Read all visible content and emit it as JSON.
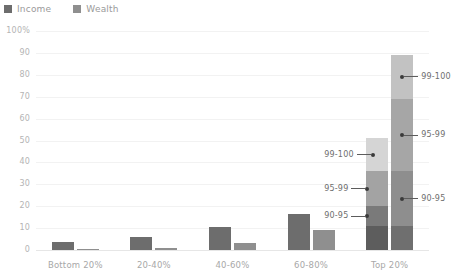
{
  "legend": {
    "items": [
      {
        "label": "Income",
        "color": "#6d6d6d",
        "icon": "square-swatch-icon"
      },
      {
        "label": "Wealth",
        "color": "#8f8f8f",
        "icon": "square-swatch-icon"
      }
    ]
  },
  "axis": {
    "y_ticks": [
      "100%",
      "90",
      "80",
      "70",
      "60",
      "50",
      "40",
      "30",
      "20",
      "10",
      "0"
    ],
    "x_ticks": [
      "Bottom 20%",
      "20-40%",
      "40-60%",
      "60-80%",
      "Top 20%"
    ]
  },
  "chart_data": {
    "type": "bar",
    "title": "",
    "xlabel": "",
    "ylabel": "",
    "ylim": [
      0,
      100
    ],
    "grid": true,
    "legend_position": "top-left",
    "categories": [
      "Bottom 20%",
      "20-40%",
      "40-60%",
      "60-80%",
      "Top 20%"
    ],
    "series": [
      {
        "name": "Income",
        "color": "#6d6d6d",
        "values": [
          3.5,
          6,
          10.5,
          16.5,
          51
        ]
      },
      {
        "name": "Wealth",
        "color": "#8f8f8f",
        "values": [
          0.6,
          1,
          3,
          9,
          89
        ]
      }
    ],
    "stacked_top_group": {
      "category": "Top 20%",
      "segment_labels": [
        "80-90",
        "90-95",
        "95-99",
        "99-100"
      ],
      "Income": {
        "segments": [
          {
            "label": "80-90",
            "value": 11,
            "color": "#5d5d5d"
          },
          {
            "label": "90-95",
            "value": 9,
            "color": "#7a7a7a"
          },
          {
            "label": "95-99",
            "value": 16,
            "color": "#a3a3a3"
          },
          {
            "label": "99-100",
            "value": 15,
            "color": "#d5d5d5"
          }
        ],
        "total": 51
      },
      "Wealth": {
        "segments": [
          {
            "label": "80-90",
            "value": 11,
            "color": "#6f6f6f"
          },
          {
            "label": "90-95",
            "value": 25,
            "color": "#8e8e8e"
          },
          {
            "label": "95-99",
            "value": 33,
            "color": "#a6a6a6"
          },
          {
            "label": "99-100",
            "value": 20,
            "color": "#c2c2c2"
          }
        ],
        "total": 89
      }
    },
    "annotations": [
      {
        "label": "99-100",
        "series": "Income",
        "side": "left"
      },
      {
        "label": "95-99",
        "series": "Income",
        "side": "left"
      },
      {
        "label": "90-95",
        "series": "Income",
        "side": "left"
      },
      {
        "label": "99-100",
        "series": "Wealth",
        "side": "right"
      },
      {
        "label": "95-99",
        "series": "Wealth",
        "side": "right"
      },
      {
        "label": "90-95",
        "series": "Wealth",
        "side": "right"
      }
    ]
  },
  "annotation_labels": {
    "income_99_100": "99-100",
    "income_95_99": "95-99",
    "income_90_95": "90-95",
    "wealth_99_100": "99-100",
    "wealth_95_99": "95-99",
    "wealth_90_95": "90-95"
  }
}
